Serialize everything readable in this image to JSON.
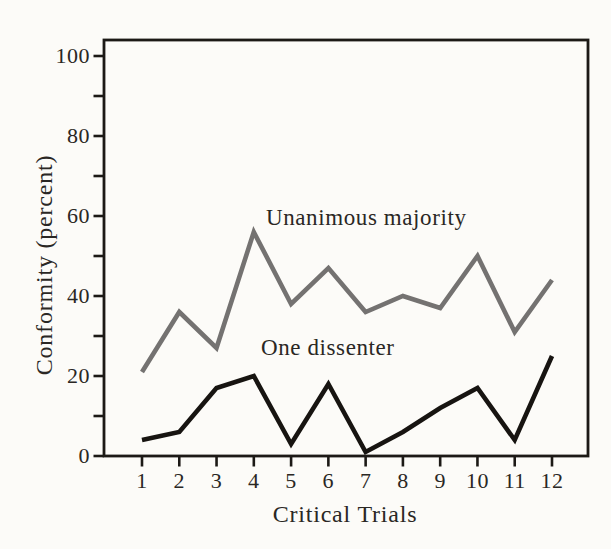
{
  "figure": {
    "background_color": "#fcfbf8",
    "axis_color": "#1c1916",
    "text_color": "#2a2724"
  },
  "chart_data": {
    "type": "line",
    "title": "",
    "xlabel": "Critical Trials",
    "ylabel": "Conformity (percent)",
    "x": [
      1,
      2,
      3,
      4,
      5,
      6,
      7,
      8,
      9,
      10,
      11,
      12
    ],
    "x_tick_labels": [
      "1",
      "2",
      "3",
      "4",
      "5",
      "6",
      "7",
      "8",
      "9",
      "10",
      "11",
      "12"
    ],
    "y_major_ticks": [
      0,
      20,
      40,
      60,
      80,
      100
    ],
    "y_minor_ticks": [
      10,
      30,
      50,
      70,
      90
    ],
    "ylim": [
      0,
      104
    ],
    "grid": false,
    "legend": "inline-text-labels",
    "series": [
      {
        "name": "Unanimous majority",
        "color": "#747271",
        "values": [
          21,
          36,
          27,
          56,
          38,
          47,
          36,
          40,
          37,
          50,
          31,
          44
        ]
      },
      {
        "name": "One dissenter",
        "color": "#171411",
        "values": [
          4,
          6,
          17,
          20,
          3,
          18,
          1,
          6,
          12,
          17,
          4,
          25
        ]
      }
    ]
  }
}
